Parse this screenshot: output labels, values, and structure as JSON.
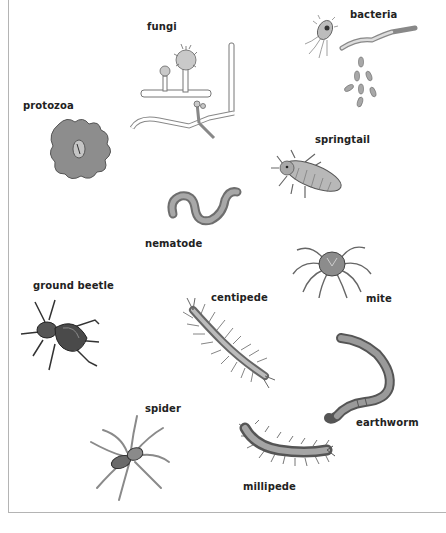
{
  "diagram": {
    "title": "",
    "organisms": [
      {
        "id": "fungi",
        "label": "fungi"
      },
      {
        "id": "bacteria",
        "label": "bacteria"
      },
      {
        "id": "protozoa",
        "label": "protozoa"
      },
      {
        "id": "springtail",
        "label": "springtail"
      },
      {
        "id": "nematode",
        "label": "nematode"
      },
      {
        "id": "ground-beetle",
        "label": "ground beetle"
      },
      {
        "id": "centipede",
        "label": "centipede"
      },
      {
        "id": "mite",
        "label": "mite"
      },
      {
        "id": "earthworm",
        "label": "earthworm"
      },
      {
        "id": "spider",
        "label": "spider"
      },
      {
        "id": "millipede",
        "label": "millipede"
      }
    ]
  },
  "colors": {
    "background": "#ffffff",
    "border": "#b4b4b4",
    "label_text": "#222222",
    "illustration_dark": "#4a4a4a",
    "illustration_mid": "#8a8a8a",
    "illustration_light": "#c8c8c8"
  }
}
